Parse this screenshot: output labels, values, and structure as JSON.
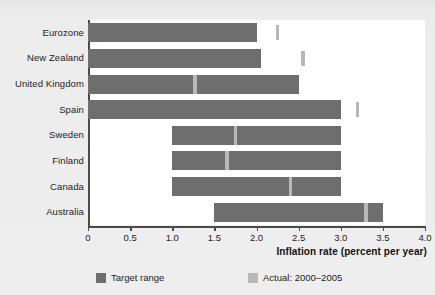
{
  "chart_data": {
    "type": "bar",
    "orientation": "horizontal",
    "subtype": "range-bar-with-marker",
    "title": "",
    "xlabel": "Inflation rate (percent per year)",
    "ylabel": "",
    "xlim": [
      0,
      4.0
    ],
    "xticks": [
      "0",
      "0.5",
      "1.0",
      "1.5",
      "2.0",
      "2.5",
      "3.0",
      "3.5",
      "4.0"
    ],
    "xtick_values": [
      0,
      0.5,
      1.0,
      1.5,
      2.0,
      2.5,
      3.0,
      3.5,
      4.0
    ],
    "grid": false,
    "legend_position": "bottom",
    "categories": [
      "Eurozone",
      "New Zealand",
      "United Kingdom",
      "Spain",
      "Sweden",
      "Finland",
      "Canada",
      "Australia"
    ],
    "series": [
      {
        "name": "Target range",
        "color": "#6e6e6e",
        "type": "range",
        "ranges": [
          [
            0.0,
            2.0
          ],
          [
            0.0,
            2.05
          ],
          [
            0.0,
            2.5
          ],
          [
            0.0,
            3.0
          ],
          [
            1.0,
            3.0
          ],
          [
            1.0,
            3.0
          ],
          [
            1.0,
            3.0
          ],
          [
            1.5,
            3.5
          ]
        ]
      },
      {
        "name": "Actual: 2000–2005",
        "color": "#b8b8b8",
        "type": "marker",
        "values": [
          2.25,
          2.55,
          1.27,
          3.2,
          1.75,
          1.65,
          2.4,
          3.3
        ]
      }
    ]
  },
  "axis": {
    "x_title": "Inflation rate (percent per year)"
  },
  "legend": {
    "items": [
      {
        "label": "Target range",
        "color": "#6e6e6e"
      },
      {
        "label": "Actual: 2000–2005",
        "color": "#b8b8b8"
      }
    ]
  },
  "colors": {
    "target_range": "#6e6e6e",
    "actual": "#b8b8b8",
    "axis": "#4a4a4a",
    "plot_background": "#ffffff",
    "page_background": "#ebebeb",
    "text": "#1c1c1c"
  }
}
